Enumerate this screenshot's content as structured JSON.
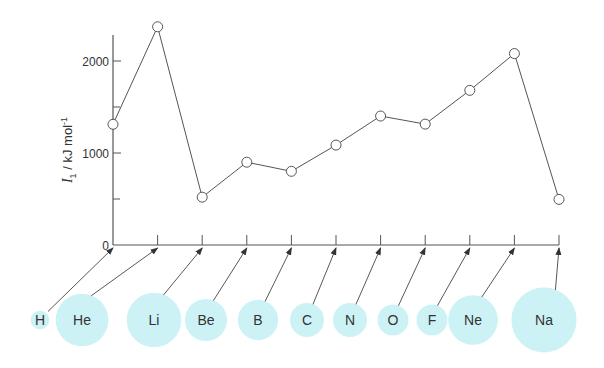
{
  "chart_data": {
    "type": "line",
    "title": "",
    "xlabel": "",
    "ylabel": "I1 / kJ mol-1",
    "ylabel_parts": {
      "symbol": "I",
      "sub": "1",
      "unit": " / kJ mol",
      "sup": "-1"
    },
    "ylim": [
      0,
      2400
    ],
    "yticks": [
      0,
      1000,
      2000
    ],
    "yticks_minor": [
      500,
      1500
    ],
    "ytick_labels": [
      "0",
      "1000",
      "2000"
    ],
    "grid": false,
    "legend": null,
    "categories": [
      "H",
      "He",
      "Li",
      "Be",
      "B",
      "C",
      "N",
      "O",
      "F",
      "Ne",
      "Na"
    ],
    "series": [
      {
        "name": "First ionization energy",
        "values": [
          1312,
          2372,
          520,
          900,
          801,
          1086,
          1402,
          1314,
          1681,
          2081,
          496
        ]
      }
    ],
    "atomic_radius_relative": [
      0.3,
      0.85,
      0.88,
      0.68,
      0.65,
      0.55,
      0.55,
      0.5,
      0.5,
      0.8,
      1.05
    ],
    "circle_color": "#cdf2f6",
    "line_color": "#555555"
  }
}
